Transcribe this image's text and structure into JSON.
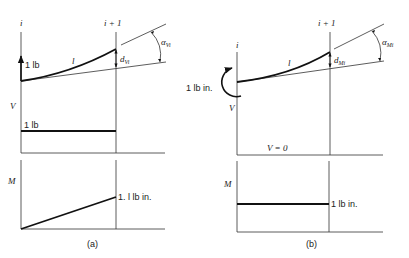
{
  "figure": {
    "panels": [
      {
        "id": "a",
        "caption": "(a)",
        "stations": {
          "left": "i",
          "right": "i + 1"
        },
        "beam": {
          "length_label": "l",
          "deflection_label": "d",
          "deflection_sub": "Vi",
          "angle_label": "α",
          "angle_sub": "Vi"
        },
        "load": {
          "type": "force",
          "label": "1 lb"
        },
        "shear_diagram": {
          "axis_label": "V",
          "value_label": "1 lb"
        },
        "moment_diagram": {
          "axis_label": "M",
          "value_label": "1. l lb in."
        }
      },
      {
        "id": "b",
        "caption": "(b)",
        "stations": {
          "left": "i",
          "right": "i + 1"
        },
        "beam": {
          "length_label": "l",
          "deflection_label": "d",
          "deflection_sub": "Mi",
          "angle_label": "α",
          "angle_sub": "Mi"
        },
        "load": {
          "type": "moment",
          "label": "1 lb in."
        },
        "shear_diagram": {
          "axis_label": "V",
          "value_label": "V = 0"
        },
        "moment_diagram": {
          "axis_label": "M",
          "value_label": "1 lb in."
        }
      }
    ]
  },
  "colors": {
    "ink": "#111111",
    "background": "#ffffff"
  }
}
